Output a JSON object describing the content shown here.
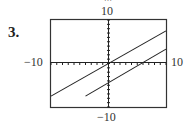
{
  "problem": {
    "number": "3.",
    "cut_text": "…"
  },
  "chart_data": {
    "type": "line",
    "title": "",
    "xlabel": "",
    "ylabel": "",
    "xlim": [
      -10,
      10
    ],
    "ylim": [
      -10,
      10
    ],
    "tick_labels": {
      "x_min": "−10",
      "x_max": "10",
      "y_min": "−10",
      "y_max": "10"
    },
    "grid": false,
    "axis_ticks": "unit tick marks along both axes",
    "series": [
      {
        "name": "line 1",
        "x": [
          -10,
          10
        ],
        "y": [
          -7.5,
          7.5
        ]
      },
      {
        "name": "line 2",
        "x": [
          -4,
          10
        ],
        "y": [
          -7.5,
          3.3
        ]
      }
    ]
  }
}
